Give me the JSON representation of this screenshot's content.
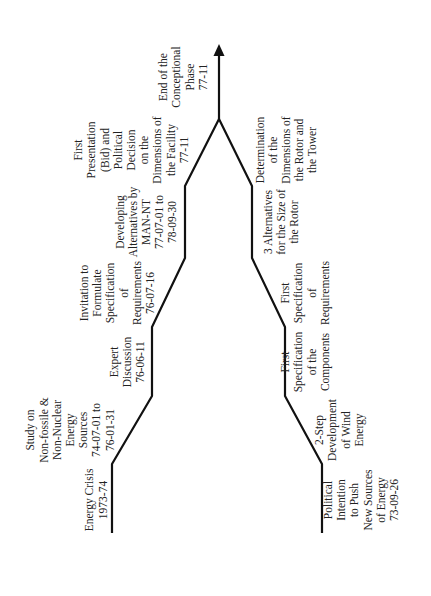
{
  "diagram": {
    "orientation": "rotated-90-ccw",
    "line_color": "#111111",
    "text_color": "#222222",
    "upper_track": {
      "name": "political-track",
      "milestones": [
        {
          "id": "energy-crisis",
          "lines": [
            "Energy Crisis",
            "1973-74"
          ]
        },
        {
          "id": "study-non-fossile",
          "lines": [
            "Study on",
            "Non-fossile &",
            "Non-Nuclear",
            "Energy",
            "Sources",
            "74-07-01 to",
            "76-01-31"
          ]
        },
        {
          "id": "expert-discussion",
          "lines": [
            "Expert",
            "Discussion",
            "76-06-11"
          ]
        },
        {
          "id": "invitation-specification",
          "lines": [
            "Invitation to",
            "Formulate",
            "Specification",
            "of",
            "Requirements",
            "76-07-16"
          ]
        },
        {
          "id": "developing-alternatives",
          "lines": [
            "Developing",
            "Alternatives by",
            "MAN-NT",
            "77-07-01 to",
            "78-09-30"
          ]
        },
        {
          "id": "first-presentation",
          "lines": [
            "First",
            "Presentation",
            "(Bid) and",
            "Political",
            "Decision",
            "on the",
            "Dimensions of",
            "the Facility",
            "77-11"
          ]
        }
      ]
    },
    "merge_milestone": {
      "id": "end-conceptional-phase",
      "lines": [
        "End of the",
        "Conceptional",
        "Phase",
        "77-11"
      ]
    },
    "lower_track": {
      "name": "technical-track",
      "milestones": [
        {
          "id": "political-intention",
          "lines": [
            "Political",
            "Intention",
            "to Push",
            "New Sources",
            "of Energy",
            "73-09-26"
          ]
        },
        {
          "id": "two-step-development",
          "lines": [
            "2-Step",
            "Development",
            "of Wind",
            "Energy"
          ]
        },
        {
          "id": "first-spec-components",
          "lines": [
            "First",
            "Specification",
            "of the",
            "Components"
          ]
        },
        {
          "id": "first-spec-requirements",
          "lines": [
            "First",
            "Specification",
            "of",
            "Requirements"
          ]
        },
        {
          "id": "three-alternatives-rotor",
          "lines": [
            "3 Alternatives",
            "for the Size of",
            "the Rotor"
          ]
        },
        {
          "id": "determination-dimensions",
          "lines": [
            "Determination",
            "of the",
            "Dimensions of",
            "the Rotor and",
            "the Tower"
          ]
        }
      ]
    }
  }
}
